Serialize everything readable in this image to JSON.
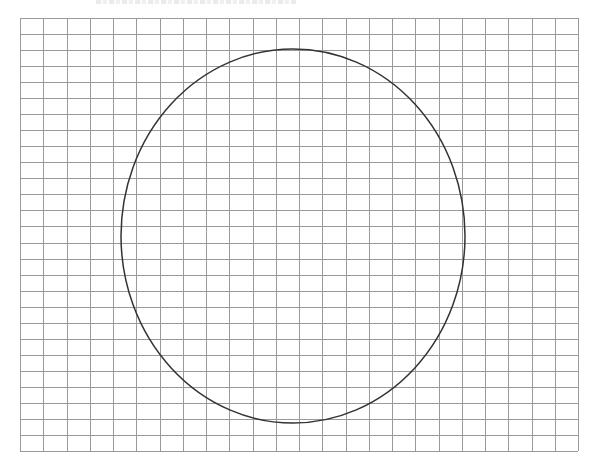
{
  "caption": {
    "text": "",
    "visible": "clipped at top edge (illegible)"
  },
  "grid": {
    "left": 20,
    "top": 18,
    "right": 578,
    "bottom": 451,
    "columns": 24,
    "rows": 27,
    "line_color": "#9a9a9a"
  },
  "ellipse": {
    "cx": 293,
    "cy": 236,
    "rx": 172,
    "ry": 187,
    "stroke_color": "#333333"
  }
}
